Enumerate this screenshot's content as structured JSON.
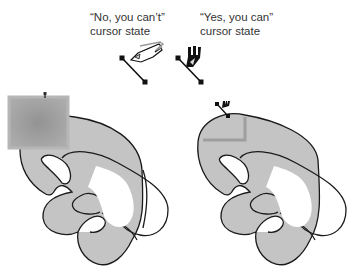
{
  "captions": {
    "no": {
      "line1": "“No, you can’t”",
      "line2": "cursor state"
    },
    "yes": {
      "line1": "“Yes, you can”",
      "line2": "cursor state"
    }
  },
  "colors": {
    "shape_fill": "#c4c4c4",
    "outline": "#1a1a1a",
    "rect_fill": "#a8a8a8",
    "rect_center": "#959595",
    "rect_border": "#b8b8b8",
    "cursor": "#111111"
  }
}
